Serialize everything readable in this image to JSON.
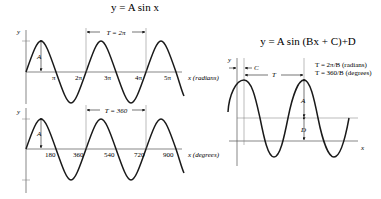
{
  "left_title": "y = A sin x",
  "right_title": "y = A sin (Bx + C)+D",
  "top_graph": {
    "y_label": "y",
    "amplitude_label": "A",
    "period_label": "T = 2π",
    "ticks": [
      "π",
      "2π",
      "3π",
      "4π",
      "5π"
    ],
    "x_label": "x (radians)"
  },
  "bottom_graph": {
    "y_label": "y",
    "amplitude_label": "A",
    "period_label": "T = 360",
    "ticks": [
      "180",
      "360",
      "540",
      "720",
      "900"
    ],
    "x_label": "x (degrees)"
  },
  "right_graph": {
    "y_label": "y",
    "phase_label": "C",
    "period_label": "T",
    "amplitude_label": "A",
    "offset_label": "D",
    "x_label": "x",
    "formula_radians": "T = 2π/B (radians)",
    "formula_degrees": "T = 360/B (degrees)"
  }
}
